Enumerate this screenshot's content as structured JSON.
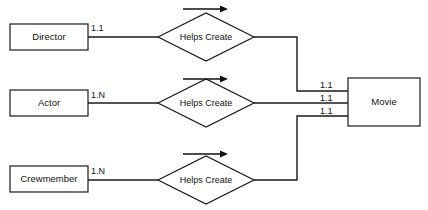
{
  "diagram": {
    "type": "entity-relationship",
    "background_color": "#ffffff",
    "line_color": "#1a1a1a",
    "entities": [
      {
        "id": "director",
        "label": "Director",
        "x": 10,
        "y": 24,
        "w": 78,
        "h": 26
      },
      {
        "id": "actor",
        "label": "Actor",
        "x": 10,
        "y": 90,
        "w": 78,
        "h": 26
      },
      {
        "id": "crewmember",
        "label": "Crewmember",
        "x": 10,
        "y": 166,
        "w": 78,
        "h": 26
      },
      {
        "id": "movie",
        "label": "Movie",
        "x": 348,
        "y": 78,
        "w": 72,
        "h": 48
      }
    ],
    "relationships": [
      {
        "id": "helps-create-director",
        "label": "Helps Create",
        "cx": 206,
        "cy": 37,
        "rx": 48,
        "ry": 24
      },
      {
        "id": "helps-create-actor",
        "label": "Helps Create",
        "cx": 206,
        "cy": 103,
        "rx": 48,
        "ry": 24
      },
      {
        "id": "helps-create-crewmember",
        "label": "Helps Create",
        "cx": 206,
        "cy": 180,
        "rx": 48,
        "ry": 24
      }
    ],
    "direction_arrows": [
      {
        "id": "arrow-director",
        "x1": 183,
        "x2": 228,
        "y": 9
      },
      {
        "id": "arrow-actor",
        "x1": 183,
        "x2": 228,
        "y": 79
      },
      {
        "id": "arrow-crewmember",
        "x1": 183,
        "x2": 228,
        "y": 154
      }
    ],
    "cardinalities": [
      {
        "id": "card-director-left",
        "value": "1.1",
        "x": 91,
        "y": 31
      },
      {
        "id": "card-actor-left",
        "value": "1.N",
        "x": 91,
        "y": 98
      },
      {
        "id": "card-crewmember-left",
        "value": "1.N",
        "x": 91,
        "y": 174
      },
      {
        "id": "card-movie-top",
        "value": "1.1",
        "x": 320,
        "y": 88
      },
      {
        "id": "card-movie-middle",
        "value": "1.1",
        "x": 320,
        "y": 101
      },
      {
        "id": "card-movie-bottom",
        "value": "1.1",
        "x": 320,
        "y": 114
      }
    ],
    "connectors": [
      {
        "id": "connector-director-to-relationship",
        "path": "M 88 37 L 158 37"
      },
      {
        "id": "connector-actor-to-relationship",
        "path": "M 88 103 L 158 103"
      },
      {
        "id": "connector-crewmember-to-relationship",
        "path": "M 88 180 L 158 180"
      },
      {
        "id": "connector-relationship-director-to-movie",
        "path": "M 254 37 L 297 37 L 297 91 L 348 91"
      },
      {
        "id": "connector-relationship-actor-to-movie",
        "path": "M 254 103 L 348 103"
      },
      {
        "id": "connector-relationship-crewmember-to-movie",
        "path": "M 254 180 L 297 180 L 297 116 L 348 116"
      }
    ]
  }
}
